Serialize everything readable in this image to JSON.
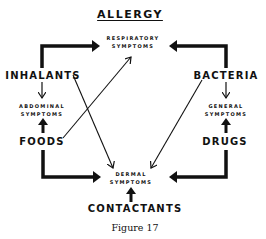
{
  "title": "ALLERGY",
  "nodes": {
    "respiratory": {
      "line1": "RESPIRATORY",
      "line2": "SYMPTOMS"
    },
    "inhalants": "INHALANTS",
    "bacteria": "BACTERIA",
    "abdominal": {
      "line1": "ABDOMINAL",
      "line2": "SYMPTOMS"
    },
    "general": {
      "line1": "GENERAL",
      "line2": "SYMPTOMS"
    },
    "foods": "FOODS",
    "drugs": "DRUGS",
    "dermal": {
      "line1": "DERMAL",
      "line2": "SYMPTOMS"
    },
    "contactants": "CONTACTANTS"
  },
  "caption": "Figure 17",
  "colors": {
    "ink": "#111111",
    "background": "#ffffff"
  }
}
